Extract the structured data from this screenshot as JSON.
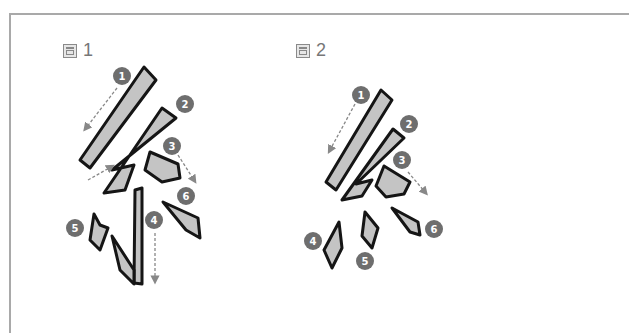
{
  "figures": [
    {
      "label_prefix": "圖",
      "label_number": "1",
      "icon": "figure-icon",
      "strokes": [
        {
          "number": "1",
          "direction": "down-left"
        },
        {
          "number": "2",
          "direction": "down-left"
        },
        {
          "number": "3",
          "direction": "down-right"
        },
        {
          "number": "4",
          "direction": "down"
        },
        {
          "number": "5",
          "direction": "none"
        },
        {
          "number": "6",
          "direction": "none"
        }
      ]
    },
    {
      "label_prefix": "圖",
      "label_number": "2",
      "icon": "figure-icon",
      "strokes": [
        {
          "number": "1",
          "direction": "down-left"
        },
        {
          "number": "2",
          "direction": "down-left"
        },
        {
          "number": "3",
          "direction": "down-right"
        },
        {
          "number": "4",
          "direction": "none"
        },
        {
          "number": "5",
          "direction": "none"
        },
        {
          "number": "6",
          "direction": "none"
        }
      ]
    }
  ],
  "colors": {
    "badge": "#6e6e6e",
    "stroke_outline": "#1a1a1a",
    "stroke_fill": "#bdbdbd",
    "arrow": "#888888",
    "border": "#a9a9a9"
  }
}
